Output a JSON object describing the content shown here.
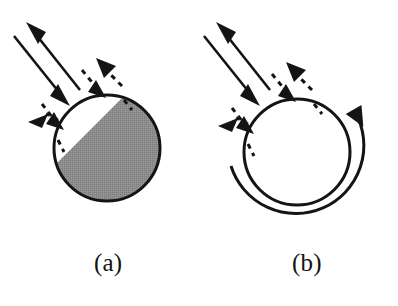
{
  "figure": {
    "background_color": "#ffffff",
    "ink_color": "#141414",
    "shaded_fill_color": "#8c8c8c",
    "panels": [
      {
        "id": "a",
        "label": "(a)",
        "label_x": 112,
        "label_y": 265,
        "body": {
          "name": "half-shaded-sphere",
          "shape": "circle",
          "center_x": 107,
          "center_y": 148,
          "radius": 53,
          "outline_width": 3,
          "shading": "lower-right half filled gray, upper-left half white",
          "terminator_angle_deg": 45
        },
        "arrows": [
          {
            "name": "incident-solid-arrow",
            "style": "solid",
            "heads": 1,
            "direction": "toward-sphere",
            "from_x": 16,
            "from_y": 38,
            "to_x": 66,
            "to_y": 101
          },
          {
            "name": "reflected-solid-arrow",
            "style": "solid",
            "heads": 1,
            "direction": "away-from-sphere",
            "from_x": 79,
            "from_y": 88,
            "to_x": 29,
            "to_y": 22
          },
          {
            "name": "upper-contact-dashed-double-arrow",
            "style": "dashed",
            "heads": 2,
            "contact_x": 104,
            "contact_y": 98
          },
          {
            "name": "lower-contact-dashed-double-arrow",
            "style": "dashed",
            "heads": 2,
            "contact_x": 61,
            "contact_y": 131
          }
        ]
      },
      {
        "id": "b",
        "label": "(b)",
        "label_x": 310,
        "label_y": 265,
        "body": {
          "name": "open-circle",
          "shape": "circle",
          "center_x": 297,
          "center_y": 152,
          "radius": 53,
          "outline_width": 3,
          "shading": "none (white)"
        },
        "rotation_arrow": {
          "name": "counterclockwise-rotation-arrow",
          "sense": "counterclockwise",
          "radius": 68,
          "start_angle_deg": 168,
          "end_angle_deg": -60,
          "arrowhead_at": "top-right",
          "stroke_width": 3
        },
        "arrows": [
          {
            "name": "incident-solid-arrow",
            "style": "solid",
            "heads": 1,
            "direction": "toward-circle",
            "from_x": 206,
            "from_y": 38,
            "to_x": 256,
            "to_y": 101
          },
          {
            "name": "reflected-solid-arrow",
            "style": "solid",
            "heads": 1,
            "direction": "away-from-circle",
            "from_x": 269,
            "from_y": 88,
            "to_x": 219,
            "to_y": 22
          },
          {
            "name": "upper-contact-dashed-double-arrow",
            "style": "dashed",
            "heads": 2,
            "contact_x": 294,
            "contact_y": 102
          },
          {
            "name": "lower-contact-dashed-double-arrow",
            "style": "dashed",
            "heads": 2,
            "contact_x": 251,
            "contact_y": 135
          }
        ]
      }
    ]
  }
}
